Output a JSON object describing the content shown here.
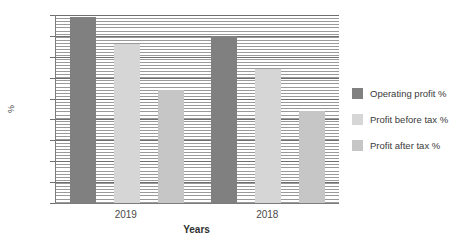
{
  "chart_data": {
    "type": "bar",
    "title": "",
    "xlabel": "Years",
    "ylabel": "%",
    "categories": [
      "2019",
      "2018"
    ],
    "series": [
      {
        "name": "Operating profit %",
        "values": [
          8.9,
          8.0
        ],
        "color": "#808080"
      },
      {
        "name": "Profit before tax %",
        "values": [
          7.6,
          6.4
        ],
        "color": "#d6d6d6"
      },
      {
        "name": "Profit after tax %",
        "values": [
          5.4,
          4.4
        ],
        "color": "#c6c6c6"
      }
    ],
    "ylim": [
      0,
      9
    ],
    "yticks": [
      0,
      1,
      2,
      3,
      4,
      5,
      6,
      7,
      8,
      9
    ],
    "ytick_labels": [
      "0",
      "1",
      "2",
      "3",
      "4",
      "5",
      "6",
      "7",
      "8",
      "9"
    ],
    "grid": true,
    "grid_minor": true,
    "legend_position": "right"
  },
  "legend": {
    "items": [
      {
        "label": "Operating profit %"
      },
      {
        "label": "Profit before tax %"
      },
      {
        "label": "Profit after tax %"
      }
    ]
  },
  "axes": {
    "y_title": "%",
    "x_title": "Years",
    "x_labels": [
      "2019",
      "2018"
    ],
    "y_labels": [
      "9",
      "8",
      "7",
      "6",
      "5",
      "4",
      "3",
      "2",
      "1",
      "0"
    ]
  }
}
